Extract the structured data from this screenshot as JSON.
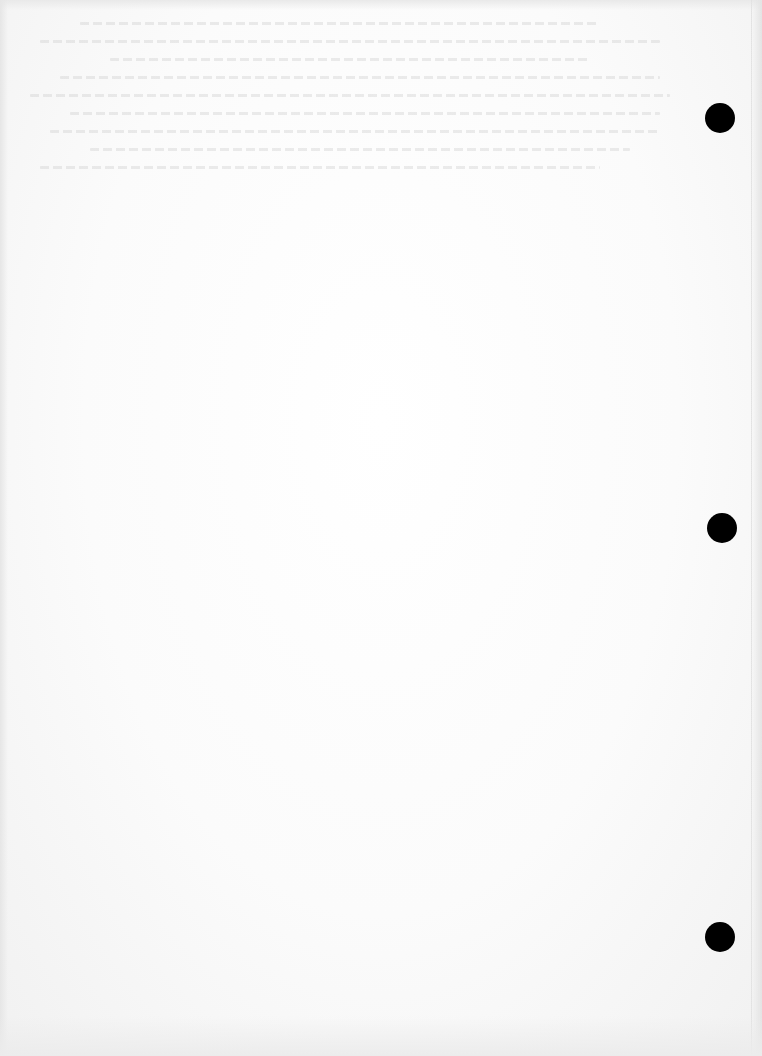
{
  "document": {
    "type": "scanned-blank-page",
    "background_color": "#fbfbfb",
    "bleed_through_text": {
      "legible": false,
      "region": "top"
    },
    "punch_holes": [
      {
        "id": "hole-top",
        "cx": 720,
        "cy": 118,
        "diameter": 30,
        "color": "#000000"
      },
      {
        "id": "hole-middle",
        "cx": 722,
        "cy": 528,
        "diameter": 30,
        "color": "#000000"
      },
      {
        "id": "hole-bottom",
        "cx": 720,
        "cy": 937,
        "diameter": 30,
        "color": "#000000"
      }
    ]
  }
}
